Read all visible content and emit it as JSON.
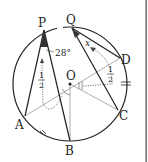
{
  "diagram": {
    "type": "circle-geometry",
    "points": {
      "P": {
        "label": "P"
      },
      "Q": {
        "label": "Q"
      },
      "D": {
        "label": "D"
      },
      "O": {
        "label": "O"
      },
      "C": {
        "label": "C"
      },
      "A": {
        "label": "A"
      },
      "B": {
        "label": "B"
      }
    },
    "annotations": {
      "angle_P": "28°",
      "angle_Q": "x",
      "half_left_num": "1",
      "half_left_den": "2",
      "half_right_num": "1",
      "half_right_den": "2"
    },
    "colors": {
      "stroke": "#222222",
      "thin_stroke": "#999999",
      "fill_angle": "#333333",
      "right_bar": "#555555"
    }
  }
}
